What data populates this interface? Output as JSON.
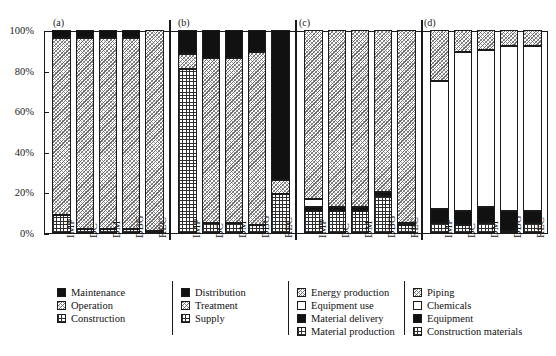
{
  "chart_data": {
    "type": "bar",
    "subtype": "stacked-percentage",
    "title": "",
    "xlabel": "",
    "ylabel": "",
    "ylim": [
      0,
      100
    ],
    "ytick_labels": [
      "0%",
      "20%",
      "40%",
      "60%",
      "80%",
      "100%"
    ],
    "ytick_values": [
      0,
      20,
      40,
      60,
      80,
      100
    ],
    "grid": false,
    "legend_position": "below",
    "categories": [
      "IMP",
      "DC",
      "DM",
      "DBG",
      "REC"
    ],
    "panels": [
      {
        "letter": "(a)",
        "categories": [
          "IMP",
          "DC",
          "DM",
          "DBG",
          "REC"
        ],
        "series": [
          {
            "name": "Construction",
            "pattern": "grid",
            "values": [
              9,
              2,
              2,
              2,
              1
            ]
          },
          {
            "name": "Operation",
            "pattern": "diag",
            "values": [
              87,
              94,
              94,
              94,
              99
            ]
          },
          {
            "name": "Maintenance",
            "pattern": "black",
            "values": [
              4,
              4,
              4,
              4,
              0
            ]
          }
        ]
      },
      {
        "letter": "(b)",
        "categories": [
          "IMP",
          "DC",
          "DM",
          "DBG",
          "REC"
        ],
        "series": [
          {
            "name": "Supply",
            "pattern": "grid",
            "values": [
              81,
              5,
              5,
              4,
              19
            ]
          },
          {
            "name": "Treatment",
            "pattern": "diag",
            "values": [
              7,
              81,
              81,
              85,
              7
            ]
          },
          {
            "name": "Distribution",
            "pattern": "black",
            "values": [
              12,
              14,
              14,
              11,
              74
            ]
          }
        ]
      },
      {
        "letter": "(c)",
        "categories": [
          "IMP",
          "DC",
          "DM",
          "DBG",
          "REC"
        ],
        "series": [
          {
            "name": "Material production",
            "pattern": "grid",
            "values": [
              11,
              11,
              11,
              18,
              4
            ]
          },
          {
            "name": "Material delivery",
            "pattern": "black",
            "values": [
              2,
              2,
              2,
              2,
              1
            ]
          },
          {
            "name": "Equipment use",
            "pattern": "white",
            "values": [
              4,
              0,
              0,
              0,
              0
            ]
          },
          {
            "name": "Energy production",
            "pattern": "diag",
            "values": [
              83,
              87,
              87,
              80,
              95
            ]
          }
        ]
      },
      {
        "letter": "(d)",
        "categories": [
          "IMP",
          "DC",
          "DM",
          "DBG",
          "REC"
        ],
        "series": [
          {
            "name": "Construction materials",
            "pattern": "grid",
            "values": [
              5,
              4,
              5,
              1,
              5
            ]
          },
          {
            "name": "Equipment",
            "pattern": "black",
            "values": [
              7,
              7,
              8,
              10,
              6
            ]
          },
          {
            "name": "Chemicals",
            "pattern": "white",
            "values": [
              63,
              78,
              77,
              81,
              81
            ]
          },
          {
            "name": "Piping",
            "pattern": "diag",
            "values": [
              25,
              11,
              10,
              8,
              8
            ]
          }
        ]
      }
    ]
  },
  "legends": [
    {
      "id": "legend-a",
      "items": [
        {
          "label": "Maintenance",
          "pattern": "black"
        },
        {
          "label": "Operation",
          "pattern": "diag"
        },
        {
          "label": "Construction",
          "pattern": "grid"
        }
      ]
    },
    {
      "id": "legend-b",
      "items": [
        {
          "label": "Distribution",
          "pattern": "black"
        },
        {
          "label": "Treatment",
          "pattern": "diag"
        },
        {
          "label": "Supply",
          "pattern": "grid"
        }
      ]
    },
    {
      "id": "legend-c",
      "items": [
        {
          "label": "Energy production",
          "pattern": "diag"
        },
        {
          "label": "Equipment use",
          "pattern": "white"
        },
        {
          "label": "Material delivery",
          "pattern": "black"
        },
        {
          "label": "Material production",
          "pattern": "grid"
        }
      ]
    },
    {
      "id": "legend-d",
      "items": [
        {
          "label": "Piping",
          "pattern": "diag"
        },
        {
          "label": "Chemicals",
          "pattern": "white"
        },
        {
          "label": "Equipment",
          "pattern": "black"
        },
        {
          "label": "Construction materials",
          "pattern": "grid"
        }
      ]
    }
  ],
  "colors": {
    "axis": "#1a1a1a",
    "black_fill": "#111111",
    "white_fill": "#ffffff",
    "hatch_gray": "#6e6e6e",
    "background": "#ffffff"
  }
}
